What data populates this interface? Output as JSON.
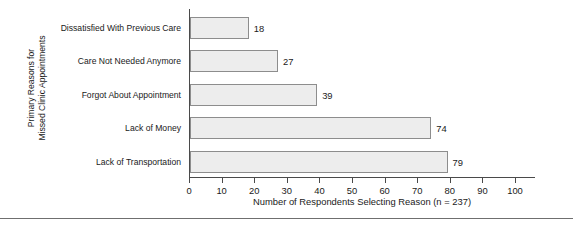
{
  "chart_data": {
    "type": "bar",
    "orientation": "horizontal",
    "title": "",
    "categories": [
      "Dissatisfied With Previous Care",
      "Care Not Needed Anymore",
      "Forgot About Appointment",
      "Lack of Money",
      "Lack of Transportation"
    ],
    "values": [
      18,
      27,
      39,
      74,
      79
    ],
    "xlabel": "Number of Respondents Selecting Reason (n = 237)",
    "ylabel_lines": [
      "Primary Reasons for",
      "Missed Clinic Appointments"
    ],
    "xlim": [
      0,
      100
    ],
    "xticks": [
      0,
      10,
      20,
      30,
      40,
      50,
      60,
      70,
      80,
      90,
      100
    ],
    "xtick_labels": [
      "0",
      "10",
      "20",
      "30",
      "40",
      "50",
      "60",
      "70",
      "80",
      "90",
      "100"
    ],
    "value_labels": [
      "18",
      "27",
      "39",
      "74",
      "79"
    ],
    "grid": false,
    "legend": false,
    "bar_fill_color": "#ededed",
    "bar_border_color": "#8d8d8d",
    "axis_color": "#4a4a4a",
    "text_color": "#1a1a1a",
    "n_total": 237
  }
}
